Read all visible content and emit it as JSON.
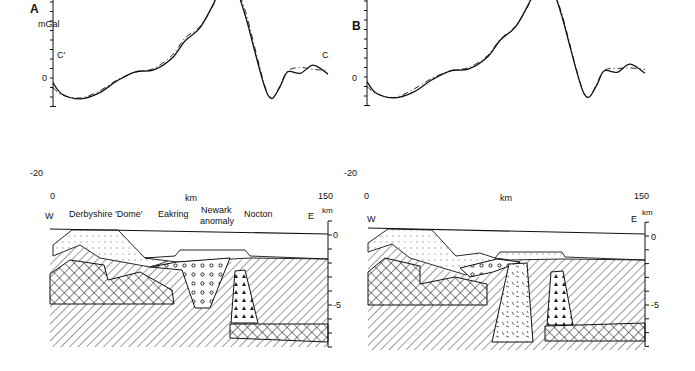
{
  "figure": {
    "panels": [
      {
        "id": "A",
        "label": "A",
        "y_unit": "mGal",
        "profile_start": "C'",
        "profile_end": "C",
        "x_label": "km",
        "x_ticks": [
          "0",
          "150"
        ],
        "y_ticks": [
          "0",
          "-20"
        ],
        "section": {
          "west": "W",
          "east": "E",
          "depth_unit": "km",
          "depth_ticks": [
            "0",
            "-5"
          ],
          "place_labels": [
            "Derbyshire 'Dome'",
            "Eakring",
            "Newark",
            "anomaly",
            "Nocton"
          ]
        }
      },
      {
        "id": "B",
        "label": "B",
        "y_unit": "",
        "profile_start": "",
        "profile_end": "",
        "x_label": "km",
        "x_ticks": [
          "0",
          "150"
        ],
        "y_ticks": [
          "0",
          "-20"
        ],
        "section": {
          "west": "W",
          "east": "E",
          "depth_unit": "km",
          "depth_ticks": [
            "0",
            "-5"
          ]
        }
      }
    ]
  },
  "chart_data": [
    {
      "type": "line",
      "title": "A",
      "xlabel": "km",
      "ylabel": "mGal",
      "xlim": [
        0,
        150
      ],
      "ylim": [
        -22,
        6
      ],
      "x_tick_step": 10,
      "y_tick_step": 2,
      "series": [
        {
          "name": "observed",
          "style": "solid",
          "x": [
            0,
            5,
            15,
            25,
            35,
            45,
            55,
            65,
            72,
            80,
            87,
            92,
            96,
            100,
            105,
            110,
            114,
            117,
            120,
            124,
            128,
            135,
            142,
            150
          ],
          "values": [
            1,
            3.4,
            4.4,
            3.2,
            0.6,
            -1.3,
            -1.7,
            -4.2,
            -7.8,
            -10.5,
            -15.2,
            -19.4,
            -20.4,
            -18.7,
            -13,
            -5.7,
            0,
            3.4,
            4.2,
            1.7,
            -1.3,
            -1,
            -2.7,
            -0.8
          ]
        },
        {
          "name": "calculated",
          "style": "dashed",
          "x": [
            0,
            5,
            15,
            25,
            35,
            45,
            55,
            65,
            72,
            80,
            87,
            92,
            96,
            100,
            105,
            110,
            114,
            117,
            120,
            124,
            128,
            135,
            142,
            150
          ],
          "values": [
            2,
            3.6,
            4.2,
            2.8,
            0.4,
            -1.2,
            -2.0,
            -4.8,
            -8.4,
            -10.8,
            -15.0,
            -19.2,
            -20.2,
            -18.8,
            -14,
            -6.5,
            -0.4,
            3.2,
            4.3,
            1.5,
            -1.5,
            -2.2,
            -1.8,
            -1.6
          ]
        }
      ]
    },
    {
      "type": "line",
      "title": "B",
      "xlabel": "km",
      "ylabel": "mGal",
      "xlim": [
        0,
        150
      ],
      "ylim": [
        -22,
        6
      ],
      "x_tick_step": 10,
      "y_tick_step": 2,
      "series": [
        {
          "name": "observed",
          "style": "solid",
          "x": [
            0,
            5,
            15,
            25,
            35,
            45,
            55,
            65,
            72,
            80,
            87,
            92,
            96,
            100,
            105,
            110,
            114,
            117,
            120,
            124,
            128,
            135,
            142,
            150
          ],
          "values": [
            1,
            3.4,
            4.4,
            3.2,
            0.6,
            -1.3,
            -1.7,
            -4.2,
            -7.8,
            -10.5,
            -15.2,
            -19.4,
            -20.4,
            -18.7,
            -13,
            -5.7,
            0,
            3.4,
            4.2,
            1.7,
            -1.3,
            -1,
            -2.7,
            -0.8
          ]
        },
        {
          "name": "calculated",
          "style": "dashed",
          "x": [
            0,
            5,
            15,
            25,
            35,
            45,
            55,
            65,
            72,
            80,
            87,
            92,
            96,
            100,
            105,
            110,
            114,
            117,
            120,
            124,
            128,
            135,
            142,
            150
          ],
          "values": [
            2,
            3.5,
            4.3,
            2.6,
            0.3,
            -1.3,
            -2.0,
            -4.5,
            -8.0,
            -10.7,
            -15.0,
            -19.3,
            -20.3,
            -18.6,
            -13.5,
            -6,
            -0.2,
            3.3,
            4.2,
            1.4,
            -1.4,
            -1.8,
            -1.9,
            -1.6
          ]
        }
      ]
    }
  ]
}
